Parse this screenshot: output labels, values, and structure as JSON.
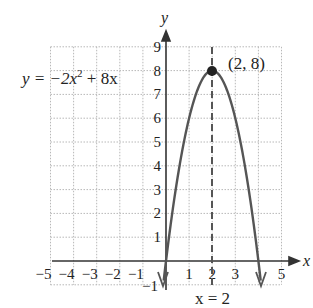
{
  "chart_data": {
    "type": "line",
    "title": "",
    "equation_label": "y = −2x² + 8x",
    "equation": {
      "base": "y = −2x",
      "exp": "2",
      "rest": " + 8x"
    },
    "xlabel": "x",
    "ylabel": "y",
    "xlim": [
      -5,
      5
    ],
    "ylim": [
      -1,
      9
    ],
    "grid": true,
    "x_ticks": [
      "−5",
      "−4",
      "−3",
      "−2",
      "−1",
      "1",
      "2",
      "3",
      "4",
      "5"
    ],
    "y_ticks": [
      "−1",
      "1",
      "2",
      "3",
      "4",
      "5",
      "6",
      "7",
      "8",
      "9"
    ],
    "series": [
      {
        "name": "y = -2x^2 + 8x",
        "x": [
          -0.12,
          0,
          0.5,
          1,
          1.5,
          2,
          2.5,
          3,
          3.5,
          4,
          4.12
        ],
        "y": [
          -1,
          0,
          3.5,
          6,
          7.5,
          8,
          7.5,
          6,
          3.5,
          0,
          -1
        ]
      }
    ],
    "vertex": {
      "x": 2,
      "y": 8,
      "label": "(2, 8)"
    },
    "axis_of_symmetry": {
      "x": 2,
      "label": "x = 2",
      "style": "dashed"
    },
    "colors": {
      "curve": "#555555",
      "grid": "#b0b0b0",
      "axis": "#333333"
    }
  }
}
